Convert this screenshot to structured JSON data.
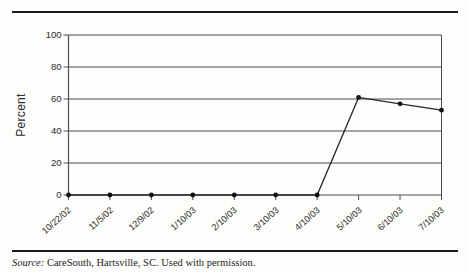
{
  "chart_data": {
    "type": "line",
    "x": [
      "10/22/02",
      "11/5/02",
      "12/9/02",
      "1/10/03",
      "2/10/03",
      "3/10/03",
      "4/10/03",
      "5/10/03",
      "6/10/03",
      "7/10/03"
    ],
    "series": [
      {
        "name": "Percent",
        "values": [
          0,
          0,
          0,
          0,
          0,
          0,
          0,
          61,
          57,
          53
        ]
      }
    ],
    "title": "",
    "xlabel": "",
    "ylabel": "Percent",
    "ylim": [
      0,
      100
    ],
    "yticks": [
      0,
      20,
      40,
      60,
      80,
      100
    ],
    "grid": "horizontal",
    "legend": "none",
    "marker": "dot",
    "line_color": "#262626",
    "grid_color": "#4d4d4d",
    "marker_color": "#111111"
  },
  "source_note": {
    "prefix": "Source:",
    "text": " CareSouth, Hartsville, SC. Used with permission."
  }
}
